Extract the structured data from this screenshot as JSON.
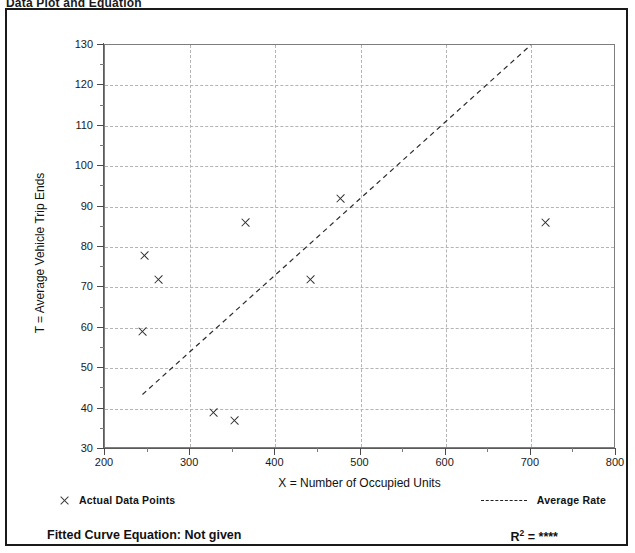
{
  "scan_title": "Data Plot and Equation",
  "chart_data": {
    "type": "scatter",
    "title": "",
    "xlabel": "X = Number of Occupied Units",
    "ylabel": "T = Average Vehicle Trip Ends",
    "xlim": [
      200,
      800
    ],
    "ylim": [
      30,
      130
    ],
    "xticks": [
      200,
      300,
      400,
      500,
      600,
      700,
      800
    ],
    "xticklabels": [
      "200",
      "300",
      "400",
      "500",
      "600",
      "700",
      "800"
    ],
    "xminor_step": 50,
    "yticks": [
      30,
      40,
      50,
      60,
      70,
      80,
      90,
      100,
      110,
      120,
      130
    ],
    "yticklabels": [
      "30",
      "40",
      "50",
      "60",
      "70",
      "80",
      "90",
      "100",
      "110",
      "120",
      "130"
    ],
    "yminor_step": 5,
    "grid": true,
    "grid_style": "dashed",
    "legend_position": "below-axes",
    "series": [
      {
        "name": "Actual Data Points",
        "type": "scatter",
        "marker": "x",
        "points": [
          {
            "x": 244,
            "y": 59
          },
          {
            "x": 247,
            "y": 78
          },
          {
            "x": 263,
            "y": 72
          },
          {
            "x": 328,
            "y": 39
          },
          {
            "x": 352,
            "y": 37
          },
          {
            "x": 365,
            "y": 86
          },
          {
            "x": 442,
            "y": 72
          },
          {
            "x": 477,
            "y": 92
          },
          {
            "x": 717,
            "y": 86
          }
        ]
      },
      {
        "name": "Average Rate",
        "type": "line",
        "style": "dashed",
        "endpoints": [
          {
            "x": 244,
            "y": 43.5
          },
          {
            "x": 700,
            "y": 130
          }
        ]
      }
    ],
    "annotations": {
      "fitted_curve_label": "Fitted Curve Equation:",
      "fitted_curve_value": "Not given",
      "r_squared_label": "R",
      "r_squared_exponent": "2",
      "r_squared_value": "= ****"
    }
  },
  "legend": {
    "actual_points_label": "Actual Data Points",
    "average_rate_label": "Average Rate"
  },
  "footer": {
    "equation_text": "Fitted Curve Equation:  Not given",
    "r2_prefix": "R",
    "r2_sup": "2",
    "r2_suffix": " = ****"
  }
}
